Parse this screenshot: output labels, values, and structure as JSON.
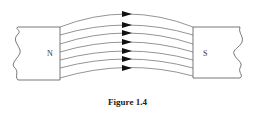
{
  "figure": {
    "caption": "Figure 1.4",
    "north_label": "N",
    "south_label": "S",
    "line_color": "#555555",
    "arrow_color": "#111111",
    "field_line_count": 7,
    "arrow_direction": "N-to-S"
  }
}
